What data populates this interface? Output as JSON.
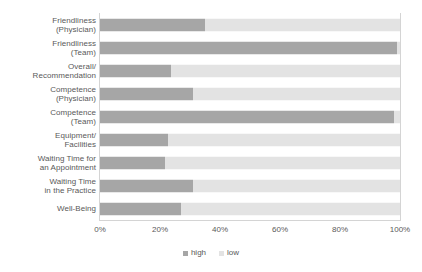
{
  "chart_data": {
    "type": "bar",
    "orientation": "horizontal",
    "stacked": true,
    "normalized_percent": true,
    "title": "",
    "subtitle": "",
    "xlabel": "",
    "ylabel": "",
    "xlim": [
      0,
      100
    ],
    "xticks": [
      "0%",
      "20%",
      "40%",
      "60%",
      "80%",
      "100%"
    ],
    "xtick_values": [
      0,
      20,
      40,
      60,
      80,
      100
    ],
    "grid": false,
    "legend_position": "bottom-center",
    "categories": [
      "Friendliness\n(Physician)",
      "Friendliness\n(Team)",
      "Overall/\nRecommendation",
      "Competence\n(Physician)",
      "Competence\n(Team)",
      "Equipment/\nFacilities",
      "Waiting Time for\nan Appointment",
      "Waiting Time\nin the Practice",
      "Well-Being"
    ],
    "series": [
      {
        "name": "high",
        "color": "#a6a6a6",
        "values": [
          35,
          99,
          23.5,
          31,
          98,
          22.5,
          21.5,
          31,
          27
        ]
      },
      {
        "name": "low",
        "color": "#e3e3e3",
        "values": [
          65,
          1,
          76.5,
          69,
          2,
          77.5,
          78.5,
          69,
          73
        ]
      }
    ]
  },
  "legend": {
    "items": [
      {
        "label": "high",
        "color": "#a6a6a6"
      },
      {
        "label": "low",
        "color": "#e3e3e3"
      }
    ]
  },
  "colors": {
    "high": "#a6a6a6",
    "low": "#e3e3e3",
    "axis": "#d4d4d4",
    "text": "#595959",
    "background": "#ffffff"
  }
}
